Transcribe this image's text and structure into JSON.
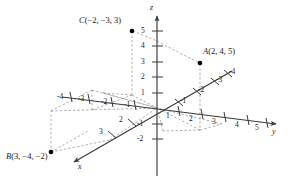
{
  "figure": {
    "axes": {
      "x": {
        "name": "x",
        "ticks_positive": [
          "2",
          "3"
        ],
        "ticks_negative": [
          "-1",
          "-2",
          "-3",
          "-4"
        ]
      },
      "y": {
        "name": "y",
        "ticks_positive": [
          "1",
          "2",
          "3",
          "4",
          "5"
        ],
        "ticks_negative": [
          "-1",
          "-2",
          "-3",
          "-4"
        ]
      },
      "z": {
        "name": "z",
        "ticks_positive": [
          "1",
          "2",
          "3",
          "4",
          "5"
        ],
        "ticks_negative": [
          "-1",
          "-2"
        ]
      }
    },
    "points": [
      {
        "id": "A",
        "label": "A(2, 4, 5)",
        "name_part": "A",
        "coords_part": "(2, 4, 5)",
        "x": 2,
        "y": 4,
        "z": 5
      },
      {
        "id": "B",
        "label": "B(3, -4, -2)",
        "name_part": "B",
        "coords_part": "(3, −4, −2)",
        "x": 3,
        "y": -4,
        "z": -2
      },
      {
        "id": "C",
        "label": "C(-2, -3, 3)",
        "name_part": "C",
        "coords_part": "(−2, −3, 3)",
        "x": -2,
        "y": -3,
        "z": 3
      }
    ],
    "colors": {
      "axis": "#3a3a3a",
      "dashed": "#8a8a8a",
      "point": "#000000",
      "text": "#1a1a1a",
      "background": "#ffffff"
    }
  }
}
